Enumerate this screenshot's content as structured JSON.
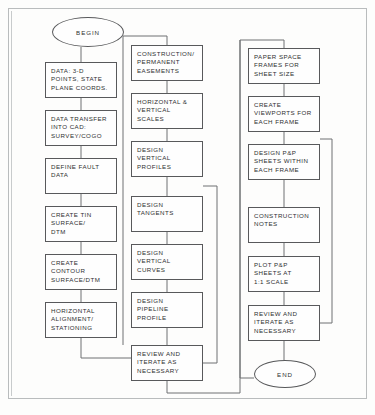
{
  "diagram": {
    "line_color": "#6e7173",
    "box_border_color": "#58595b",
    "text_color": "#2f3031",
    "background": "#fdfdfc"
  },
  "nodes": {
    "begin": {
      "label": "BEGIN",
      "shape": "terminator",
      "x": 52,
      "y": 17,
      "w": 72,
      "h": 30
    },
    "data_points": {
      "label": "DATA: 3-D\nPOINTS, STATE\nPLANE COORDS.",
      "shape": "process",
      "x": 45,
      "y": 62,
      "w": 72,
      "h": 36
    },
    "data_transfer": {
      "label": "DATA TRANSFER\nINTO CAD:\nSURVEY/COGO",
      "shape": "process",
      "x": 45,
      "y": 110,
      "w": 72,
      "h": 36
    },
    "define_fault": {
      "label": "DEFINE FAULT\nDATA",
      "shape": "process",
      "x": 45,
      "y": 158,
      "w": 72,
      "h": 36
    },
    "create_tin": {
      "label": "CREATE TIN\nSURFACE/\nDTM",
      "shape": "process",
      "x": 45,
      "y": 206,
      "w": 72,
      "h": 36
    },
    "create_contour": {
      "label": "CREATE\nCONTOUR\nSURFACE/DTM",
      "shape": "process",
      "x": 45,
      "y": 254,
      "w": 72,
      "h": 36
    },
    "horizontal_alignment": {
      "label": "HORIZONTAL\nALIGNMENT/\nSTATIONING",
      "shape": "process",
      "x": 45,
      "y": 302,
      "w": 72,
      "h": 36
    },
    "construction_easements": {
      "label": "CONSTRUCTION/\nPERMANENT\nEASEMENTS",
      "shape": "process",
      "x": 131,
      "y": 45,
      "w": 72,
      "h": 36
    },
    "horizontal_vertical_scales": {
      "label": "HORIZONTAL &\nVERTICAL\nSCALES",
      "shape": "process",
      "x": 131,
      "y": 93,
      "w": 72,
      "h": 36
    },
    "design_vertical_profiles": {
      "label": "DESIGN\nVERTICAL\nPROFILES",
      "shape": "process",
      "x": 131,
      "y": 141,
      "w": 72,
      "h": 36
    },
    "design_tangents": {
      "label": "DESIGN\nTANGENTS",
      "shape": "process",
      "x": 131,
      "y": 196,
      "w": 72,
      "h": 36
    },
    "design_vertical_curves": {
      "label": "DESIGN\nVERTICAL\nCURVES",
      "shape": "process",
      "x": 131,
      "y": 244,
      "w": 72,
      "h": 36
    },
    "design_pipeline_profile": {
      "label": "DESIGN\nPIPELINE\nPROFILE",
      "shape": "process",
      "x": 131,
      "y": 292,
      "w": 72,
      "h": 36
    },
    "review_iterate_mid": {
      "label": "REVIEW AND\nITERATE AS\nNECESSARY",
      "shape": "process",
      "x": 131,
      "y": 345,
      "w": 72,
      "h": 36
    },
    "paper_space_frames": {
      "label": "PAPER SPACE\nFRAMES FOR\nSHEET SIZE",
      "shape": "process",
      "x": 248,
      "y": 48,
      "w": 72,
      "h": 36
    },
    "create_viewports": {
      "label": "CREATE\nVIEWPORTS FOR\nEACH FRAME",
      "shape": "process",
      "x": 248,
      "y": 96,
      "w": 72,
      "h": 36
    },
    "design_pp_sheets": {
      "label": "DESIGN P&P\nSHEETS WITHIN\nEACH FRAME",
      "shape": "process",
      "x": 248,
      "y": 144,
      "w": 72,
      "h": 36
    },
    "construction_notes": {
      "label": "CONSTRUCTION\nNOTES",
      "shape": "process",
      "x": 248,
      "y": 207,
      "w": 72,
      "h": 36
    },
    "plot_pp_sheets": {
      "label": "PLOT P&P\nSHEETS AT\n1:1 SCALE",
      "shape": "process",
      "x": 248,
      "y": 256,
      "w": 72,
      "h": 36
    },
    "review_iterate_right": {
      "label": "REVIEW AND\nITERATE AS\nNECESSARY",
      "shape": "process",
      "x": 248,
      "y": 305,
      "w": 72,
      "h": 36
    },
    "end": {
      "label": "END",
      "shape": "terminator",
      "x": 254,
      "y": 360,
      "w": 62,
      "h": 28
    }
  },
  "connectors": [
    {
      "name": "begin-to-data-points",
      "from": "begin",
      "to": "data_points"
    },
    {
      "name": "data-points-to-data-transfer",
      "from": "data_points",
      "to": "data_transfer"
    },
    {
      "name": "data-transfer-to-define-fault",
      "from": "data_transfer",
      "to": "define_fault"
    },
    {
      "name": "define-fault-to-create-tin",
      "from": "define_fault",
      "to": "create_tin"
    },
    {
      "name": "create-tin-to-create-contour",
      "from": "create_tin",
      "to": "create_contour"
    },
    {
      "name": "create-contour-to-horizontal-alignment",
      "from": "create_contour",
      "to": "horizontal_alignment"
    },
    {
      "name": "horizontal-alignment-to-construction-easements",
      "from": "horizontal_alignment",
      "to": "construction_easements"
    },
    {
      "name": "construction-easements-to-scales",
      "from": "construction_easements",
      "to": "horizontal_vertical_scales"
    },
    {
      "name": "scales-to-design-vertical-profiles",
      "from": "horizontal_vertical_scales",
      "to": "design_vertical_profiles"
    },
    {
      "name": "design-vertical-profiles-to-design-tangents",
      "from": "design_vertical_profiles",
      "to": "design_tangents"
    },
    {
      "name": "design-tangents-to-design-vertical-curves",
      "from": "design_tangents",
      "to": "design_vertical_curves"
    },
    {
      "name": "design-vertical-curves-to-design-pipeline-profile",
      "from": "design_vertical_curves",
      "to": "design_pipeline_profile"
    },
    {
      "name": "design-pipeline-profile-to-review-mid",
      "from": "design_pipeline_profile",
      "to": "review_iterate_mid"
    },
    {
      "name": "review-mid-feedback-loop",
      "from": "review_iterate_mid",
      "to": "design_vertical_profiles",
      "kind": "feedback"
    },
    {
      "name": "review-mid-to-paper-space-frames",
      "from": "review_iterate_mid",
      "to": "paper_space_frames"
    },
    {
      "name": "paper-space-frames-to-create-viewports",
      "from": "paper_space_frames",
      "to": "create_viewports"
    },
    {
      "name": "create-viewports-to-design-pp-sheets",
      "from": "create_viewports",
      "to": "design_pp_sheets"
    },
    {
      "name": "design-pp-sheets-to-construction-notes",
      "from": "design_pp_sheets",
      "to": "construction_notes"
    },
    {
      "name": "construction-notes-to-plot-pp-sheets",
      "from": "construction_notes",
      "to": "plot_pp_sheets"
    },
    {
      "name": "plot-pp-sheets-to-review-right",
      "from": "plot_pp_sheets",
      "to": "review_iterate_right"
    },
    {
      "name": "review-right-feedback-loop",
      "from": "review_iterate_right",
      "to": "create_viewports",
      "kind": "feedback"
    },
    {
      "name": "review-right-to-end",
      "from": "review_iterate_right",
      "to": "end"
    }
  ]
}
